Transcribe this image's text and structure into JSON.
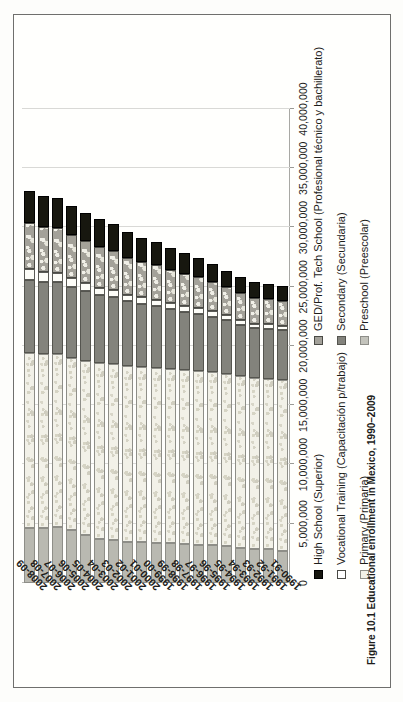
{
  "caption": "Figure 10.1  Educational enrollment in Mexico, 1990–2009",
  "chart_data": {
    "type": "bar",
    "orientation": "horizontal-stacked",
    "title": "",
    "subtitle": "",
    "xlabel": "",
    "ylabel": "",
    "grid": true,
    "legend_position": "bottom",
    "value_axis": {
      "min": 0,
      "max": 40000000,
      "step": 5000000,
      "tick_labels": [
        "0",
        "5,000,000",
        "10,000,000",
        "15,000,000",
        "20,000,000",
        "25,000,000",
        "30,000,000",
        "35,000,000",
        "40,000,000"
      ]
    },
    "categories": [
      "1990-91",
      "1991-92",
      "1992-93",
      "1993-94",
      "1994-95",
      "1995-96",
      "1996-97",
      "1997-98",
      "1998-99",
      "1999-00",
      "2000-01",
      "2001-02",
      "2002-03",
      "2003-04",
      "2004-05",
      "2005-06",
      "2006-07",
      "2007-08",
      "2008-09"
    ],
    "series": [
      {
        "name": "Preschool (Preescolar)",
        "key": "pre",
        "color": "#b9b9b1",
        "values": [
          2734054,
          2858890,
          2858890,
          2980024,
          3092834,
          3170030,
          3238203,
          3312626,
          3360518,
          3393741,
          3423608,
          3432326,
          3635903,
          3742633,
          4086828,
          4452168,
          4739234,
          4634412,
          4634412
        ]
      },
      {
        "name": "Primary (Primaria)",
        "key": "pri",
        "color": "#f2f1e8",
        "values": [
          14401588,
          14397325,
          14425669,
          14469450,
          14574202,
          14623438,
          14650521,
          14647797,
          14697915,
          14792528,
          14792528,
          14843381,
          14857191,
          14781327,
          14652879,
          14548194,
          14585804,
          14654135,
          14815008
        ]
      },
      {
        "name": "Secondary (Secundaria)",
        "key": "sec",
        "color": "#83837c",
        "values": [
          4190190,
          4160692,
          4203126,
          4341924,
          4493173,
          4687335,
          4809266,
          4929301,
          5070552,
          5208903,
          5349659,
          5480202,
          5660070,
          5780437,
          5894358,
          5979256,
          6055467,
          6116274,
          6153425
        ]
      },
      {
        "name": "Vocational Training (Capacitación p/trabajo)",
        "key": "voc",
        "color": "#ffffff",
        "values": [
          390000,
          400000,
          410000,
          430000,
          450000,
          470000,
          490000,
          510000,
          520000,
          530000,
          540000,
          560000,
          590000,
          630000,
          700000,
          760000,
          810000,
          840000,
          860000
        ]
      },
      {
        "name": "GED/Prof. Tech School (Profesional técnico y bachillerato)",
        "key": "ged",
        "color": "#a3a199",
        "values": [
          2100520,
          2138000,
          2166000,
          2244000,
          2343000,
          2438000,
          2606000,
          2713000,
          2805000,
          2892000,
          2956000,
          3121000,
          3295000,
          3443000,
          3547000,
          3658000,
          3742000,
          3830000,
          3923000
        ]
      },
      {
        "name": "High School (Superior)",
        "key": "hs",
        "color": "#17170f",
        "values": [
          1252027,
          1278000,
          1311000,
          1356000,
          1420000,
          1532000,
          1612000,
          1727000,
          1838000,
          1963000,
          2047000,
          2147000,
          2236000,
          2322000,
          2385000,
          2446000,
          2528000,
          2623000,
          2705000
        ]
      }
    ]
  },
  "legend": {
    "column_left": [
      {
        "label": "High School (Superior)",
        "key": "hs"
      },
      {
        "label": "Vocational Training (Capacitación p/trabajo)",
        "key": "voc"
      },
      {
        "label": "Primary (Primaria)",
        "key": "pri"
      }
    ],
    "column_right": [
      {
        "label": "GED/Prof. Tech School (Profesional técnico y bachillerato)",
        "key": "ged"
      },
      {
        "label": "Secondary (Secundaria)",
        "key": "sec"
      },
      {
        "label": "Preschool (Preescolar)",
        "key": "pre"
      }
    ]
  }
}
